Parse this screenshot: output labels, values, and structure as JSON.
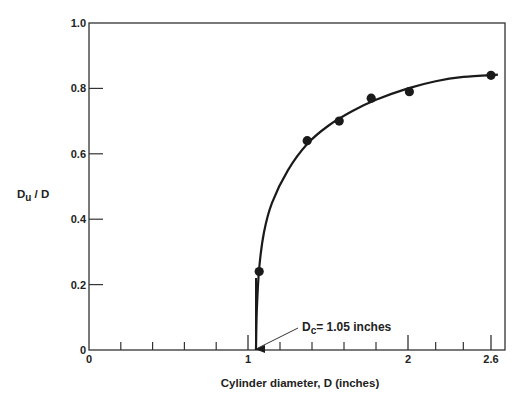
{
  "chart_data": {
    "type": "scatter",
    "title": "",
    "xlabel": "Cylinder diameter, D (inches)",
    "ylabel": "Du / D",
    "ylabel_parts": {
      "main": "D",
      "sub": "u",
      "rest": " / D"
    },
    "xlim": [
      0,
      2.6
    ],
    "ylim": [
      0,
      1.0
    ],
    "grid": false,
    "legend": null,
    "x_tick_labels": [
      {
        "value": 0,
        "label": "0"
      },
      {
        "value": 1,
        "label": "1"
      },
      {
        "value": 2,
        "label": "2"
      },
      {
        "value": 2.6,
        "label": "2.6"
      }
    ],
    "x_minor_ticks": [
      0.2,
      0.4,
      0.6,
      0.8,
      1.2,
      1.4,
      1.6,
      1.8,
      2.2,
      2.4
    ],
    "y_tick_labels": [
      {
        "value": 0,
        "label": "0"
      },
      {
        "value": 0.2,
        "label": "0.2"
      },
      {
        "value": 0.4,
        "label": "0.4"
      },
      {
        "value": 0.6,
        "label": "0.6"
      },
      {
        "value": 0.8,
        "label": "0.8"
      },
      {
        "value": 1.0,
        "label": "1.0"
      }
    ],
    "series": [
      {
        "name": "Measured Du/D",
        "type": "scatter",
        "points": [
          {
            "x": 1.07,
            "y": 0.24
          },
          {
            "x": 1.37,
            "y": 0.64
          },
          {
            "x": 1.57,
            "y": 0.7
          },
          {
            "x": 1.77,
            "y": 0.77
          },
          {
            "x": 2.01,
            "y": 0.79
          },
          {
            "x": 2.6,
            "y": 0.84
          }
        ]
      },
      {
        "name": "Fitted curve",
        "type": "line",
        "points": [
          {
            "x": 1.05,
            "y": 0.0
          },
          {
            "x": 1.055,
            "y": 0.12
          },
          {
            "x": 1.07,
            "y": 0.25
          },
          {
            "x": 1.1,
            "y": 0.36
          },
          {
            "x": 1.15,
            "y": 0.45
          },
          {
            "x": 1.25,
            "y": 0.55
          },
          {
            "x": 1.37,
            "y": 0.63
          },
          {
            "x": 1.5,
            "y": 0.685
          },
          {
            "x": 1.65,
            "y": 0.73
          },
          {
            "x": 1.8,
            "y": 0.765
          },
          {
            "x": 2.0,
            "y": 0.8
          },
          {
            "x": 2.2,
            "y": 0.822
          },
          {
            "x": 2.4,
            "y": 0.835
          },
          {
            "x": 2.65,
            "y": 0.842
          }
        ]
      }
    ],
    "annotations": [
      {
        "text_main": "D",
        "text_sub": "c",
        "text_rest": "= 1.05 inches",
        "x": 1.05,
        "y": 0,
        "arrow": true
      }
    ],
    "colors": {
      "line": "#1a1a1a",
      "marker": "#1a1a1a",
      "axis": "#333333"
    }
  }
}
